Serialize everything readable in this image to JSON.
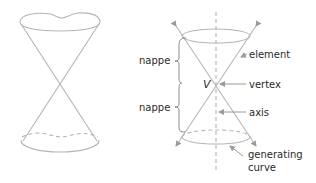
{
  "figure": {
    "left_cone": {
      "name": "double cone sketch"
    },
    "right_cone": {
      "labels": {
        "nappe_upper": "nappe",
        "nappe_lower": "nappe",
        "vertex_symbol": "V",
        "element": "element",
        "vertex": "vertex",
        "axis": "axis",
        "generating_curve_line1": "generating",
        "generating_curve_line2": "curve"
      }
    },
    "colors": {
      "line": "#b5b5b5",
      "leader": "#9a9a9a",
      "text": "#2a2a2a"
    }
  }
}
